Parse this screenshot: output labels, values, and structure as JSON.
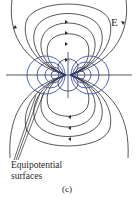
{
  "figure": {
    "field_label": "E",
    "equipotential_label_line1": "Equipotential",
    "equipotential_label_line2": "surfaces",
    "caption": "(c)"
  },
  "colors": {
    "field_lines": "#2b2b2b",
    "equipotentials": "#3b4fa8",
    "background": "#ffffff"
  },
  "dipole": {
    "center_x": 68,
    "center_y": 75
  }
}
